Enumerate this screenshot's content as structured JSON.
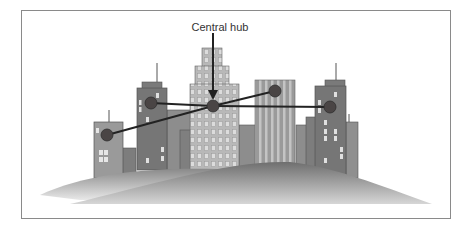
{
  "diagram": {
    "label": "Central hub",
    "colors": {
      "frame": "#8a8a8a",
      "building_dark": "#6f6f6f",
      "building_mid": "#8c8c8c",
      "building_light": "#b4b4b4",
      "window": "#e6e6e6",
      "node": "#4a4545",
      "link": "#222222",
      "hill_dark": "#777777",
      "hill_light": "#f2f2f2"
    },
    "nodes": [
      {
        "id": "left-building-node",
        "x": 107,
        "y": 135
      },
      {
        "id": "tall-left-building-node",
        "x": 151,
        "y": 103
      },
      {
        "id": "central-hub-node",
        "x": 213,
        "y": 106
      },
      {
        "id": "striped-building-node",
        "x": 275,
        "y": 91
      },
      {
        "id": "right-building-node",
        "x": 330,
        "y": 107
      }
    ],
    "links": [
      {
        "from": "tall-left-building-node",
        "to": "central-hub-node"
      },
      {
        "from": "central-hub-node",
        "to": "right-building-node"
      },
      {
        "from": "left-building-node",
        "to": "central-hub-node"
      },
      {
        "from": "central-hub-node",
        "to": "striped-building-node"
      }
    ]
  }
}
